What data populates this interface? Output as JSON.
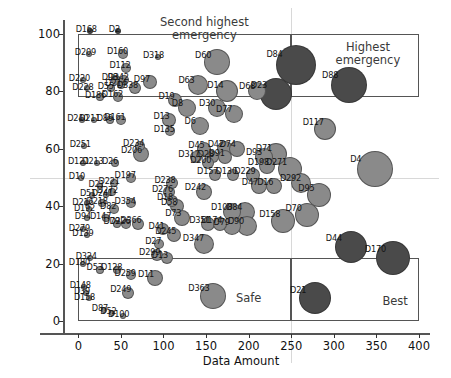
{
  "chart_data": {
    "type": "scatter",
    "title": "",
    "xlabel": "Data Amount",
    "ylabel": "Outlier Percentage",
    "xlim": [
      -18,
      400
    ],
    "ylim": [
      -4,
      104
    ],
    "xticks": [
      0,
      50,
      100,
      150,
      200,
      250,
      300,
      350,
      400
    ],
    "yticks": [
      0,
      20,
      40,
      60,
      80,
      100
    ],
    "grid": false,
    "guide_lines": {
      "x": 250,
      "y": 50
    },
    "bubble_colors": {
      "light": "#8a8a8a",
      "dark": "#4a4a4a"
    },
    "quadrants": [
      {
        "name": "second-highest-emergency",
        "label": "Second highest\nemergency",
        "x0": 0,
        "x1": 250,
        "y0": 78,
        "y1": 100,
        "label_x": 148,
        "label_y": 101.5
      },
      {
        "name": "highest-emergency",
        "label": "Highest emergency",
        "x0": 250,
        "x1": 400,
        "y0": 78,
        "y1": 100,
        "label_x": 340,
        "label_y": 93
      },
      {
        "name": "safe",
        "label": "Safe",
        "x0": 0,
        "x1": 250,
        "y0": 0,
        "y1": 22,
        "label_x": 200,
        "label_y": 8
      },
      {
        "name": "best",
        "label": "Best",
        "x0": 250,
        "x1": 400,
        "y0": 0,
        "y1": 22,
        "label_x": 372,
        "label_y": 7
      }
    ],
    "points": [
      {
        "label": "D168",
        "x": 14,
        "y": 101,
        "r": 3,
        "c": "dark"
      },
      {
        "label": "D2",
        "x": 47,
        "y": 101,
        "r": 3,
        "c": "dark"
      },
      {
        "label": "D209",
        "x": 13,
        "y": 93,
        "r": 3,
        "c": "light"
      },
      {
        "label": "D160",
        "x": 53,
        "y": 93,
        "r": 5,
        "c": "light"
      },
      {
        "label": "D318",
        "x": 93,
        "y": 92,
        "r": 3,
        "c": "light"
      },
      {
        "label": "D60",
        "x": 163,
        "y": 90,
        "r": 13,
        "c": "light"
      },
      {
        "label": "D84",
        "x": 255,
        "y": 89,
        "r": 20,
        "c": "dark"
      },
      {
        "label": "D88",
        "x": 318,
        "y": 82,
        "r": 18,
        "c": "dark"
      },
      {
        "label": "D112",
        "x": 56,
        "y": 88,
        "r": 5,
        "c": "light"
      },
      {
        "label": "D220",
        "x": 6,
        "y": 84,
        "r": 3,
        "c": "light"
      },
      {
        "label": "D98",
        "x": 44,
        "y": 84,
        "r": 5,
        "c": "light"
      },
      {
        "label": "D342",
        "x": 54,
        "y": 84,
        "r": 5,
        "c": "light"
      },
      {
        "label": "D97",
        "x": 84,
        "y": 83,
        "r": 7,
        "c": "light"
      },
      {
        "label": "D63",
        "x": 140,
        "y": 82,
        "r": 10,
        "c": "light"
      },
      {
        "label": "D228",
        "x": 10,
        "y": 81,
        "r": 3,
        "c": "light"
      },
      {
        "label": "D214",
        "x": 50,
        "y": 82,
        "r": 4,
        "c": "light"
      },
      {
        "label": "D55",
        "x": 38,
        "y": 81,
        "r": 4,
        "c": "light"
      },
      {
        "label": "D338",
        "x": 66,
        "y": 81,
        "r": 6,
        "c": "light"
      },
      {
        "label": "D14",
        "x": 175,
        "y": 80,
        "r": 11,
        "c": "light"
      },
      {
        "label": "D68",
        "x": 210,
        "y": 80,
        "r": 9,
        "c": "light"
      },
      {
        "label": "D23",
        "x": 232,
        "y": 79,
        "r": 16,
        "c": "dark"
      },
      {
        "label": "D186",
        "x": 26,
        "y": 78,
        "r": 4,
        "c": "light"
      },
      {
        "label": "D162",
        "x": 47,
        "y": 78,
        "r": 5,
        "c": "light"
      },
      {
        "label": "D19",
        "x": 113,
        "y": 77,
        "r": 7,
        "c": "light"
      },
      {
        "label": "D8",
        "x": 128,
        "y": 74,
        "r": 9,
        "c": "light"
      },
      {
        "label": "D30",
        "x": 163,
        "y": 74,
        "r": 9,
        "c": "light"
      },
      {
        "label": "D77",
        "x": 183,
        "y": 72,
        "r": 9,
        "c": "light"
      },
      {
        "label": "D89",
        "x": 37,
        "y": 70,
        "r": 4,
        "c": "light"
      },
      {
        "label": "D161",
        "x": 50,
        "y": 70,
        "r": 5,
        "c": "light"
      },
      {
        "label": "D13",
        "x": 107,
        "y": 70,
        "r": 7,
        "c": "light"
      },
      {
        "label": "D135",
        "x": 108,
        "y": 66,
        "r": 5,
        "c": "light"
      },
      {
        "label": "D6",
        "x": 143,
        "y": 68,
        "r": 9,
        "c": "light"
      },
      {
        "label": "D117",
        "x": 290,
        "y": 67,
        "r": 11,
        "c": "light"
      },
      {
        "label": "D240",
        "x": 4,
        "y": 70,
        "r": 3,
        "c": "light"
      },
      {
        "label": "D211",
        "x": 18,
        "y": 70,
        "r": 3,
        "c": "light"
      },
      {
        "label": "D251",
        "x": 7,
        "y": 61,
        "r": 3,
        "c": "light"
      },
      {
        "label": "D234",
        "x": 72,
        "y": 61,
        "r": 5,
        "c": "light"
      },
      {
        "label": "D206",
        "x": 73,
        "y": 58,
        "r": 8,
        "c": "light"
      },
      {
        "label": "D45",
        "x": 148,
        "y": 60,
        "r": 7,
        "c": "light"
      },
      {
        "label": "D42",
        "x": 172,
        "y": 60,
        "r": 8,
        "c": "light"
      },
      {
        "label": "D74",
        "x": 186,
        "y": 60,
        "r": 8,
        "c": "light"
      },
      {
        "label": "D317",
        "x": 138,
        "y": 57,
        "r": 6,
        "c": "light"
      },
      {
        "label": "D28",
        "x": 158,
        "y": 57,
        "r": 6,
        "c": "light"
      },
      {
        "label": "D91",
        "x": 172,
        "y": 57,
        "r": 7,
        "c": "light"
      },
      {
        "label": "D93",
        "x": 218,
        "y": 57,
        "r": 9,
        "c": "light"
      },
      {
        "label": "D71",
        "x": 232,
        "y": 58,
        "r": 11,
        "c": "light"
      },
      {
        "label": "D200",
        "x": 152,
        "y": 55,
        "r": 6,
        "c": "light"
      },
      {
        "label": "D198",
        "x": 222,
        "y": 54,
        "r": 8,
        "c": "light"
      },
      {
        "label": "D4",
        "x": 348,
        "y": 53,
        "r": 18,
        "c": "light"
      },
      {
        "label": "D121",
        "x": 5,
        "y": 55,
        "r": 3,
        "c": "light"
      },
      {
        "label": "D213",
        "x": 22,
        "y": 55,
        "r": 3,
        "c": "light"
      },
      {
        "label": "D26",
        "x": 43,
        "y": 55,
        "r": 4,
        "c": "light"
      },
      {
        "label": "D157",
        "x": 160,
        "y": 51,
        "r": 6,
        "c": "light"
      },
      {
        "label": "D130",
        "x": 182,
        "y": 51,
        "r": 6,
        "c": "light"
      },
      {
        "label": "D229",
        "x": 205,
        "y": 51,
        "r": 7,
        "c": "light"
      },
      {
        "label": "D271",
        "x": 248,
        "y": 53,
        "r": 12,
        "c": "light"
      },
      {
        "label": "D292",
        "x": 262,
        "y": 48,
        "r": 10,
        "c": "light"
      },
      {
        "label": "D10",
        "x": 3,
        "y": 50,
        "r": 3,
        "c": "light"
      },
      {
        "label": "D197",
        "x": 62,
        "y": 50,
        "r": 5,
        "c": "light"
      },
      {
        "label": "D221",
        "x": 42,
        "y": 48,
        "r": 4,
        "c": "light"
      },
      {
        "label": "D21",
        "x": 26,
        "y": 47,
        "r": 3,
        "c": "light"
      },
      {
        "label": "D47",
        "x": 212,
        "y": 47,
        "r": 8,
        "c": "light"
      },
      {
        "label": "D16",
        "x": 230,
        "y": 47,
        "r": 8,
        "c": "light"
      },
      {
        "label": "D95",
        "x": 283,
        "y": 44,
        "r": 12,
        "c": "light"
      },
      {
        "label": "D242",
        "x": 148,
        "y": 45,
        "r": 8,
        "c": "light"
      },
      {
        "label": "D51",
        "x": 16,
        "y": 44,
        "r": 3,
        "c": "light"
      },
      {
        "label": "D241",
        "x": 33,
        "y": 44,
        "r": 3,
        "c": "light"
      },
      {
        "label": "D272",
        "x": 40,
        "y": 45,
        "r": 4,
        "c": "light"
      },
      {
        "label": "D276",
        "x": 107,
        "y": 45,
        "r": 6,
        "c": "light"
      },
      {
        "label": "D238",
        "x": 110,
        "y": 48,
        "r": 6,
        "c": "light"
      },
      {
        "label": "D216",
        "x": 10,
        "y": 41,
        "r": 3,
        "c": "light"
      },
      {
        "label": "D218",
        "x": 28,
        "y": 41,
        "r": 4,
        "c": "light"
      },
      {
        "label": "D192",
        "x": 12,
        "y": 39,
        "r": 3,
        "c": "light"
      },
      {
        "label": "D354",
        "x": 62,
        "y": 41,
        "r": 5,
        "c": "light"
      },
      {
        "label": "D18",
        "x": 110,
        "y": 42,
        "r": 6,
        "c": "light"
      },
      {
        "label": "D58",
        "x": 116,
        "y": 40,
        "r": 7,
        "c": "light"
      },
      {
        "label": "D82",
        "x": 42,
        "y": 39,
        "r": 5,
        "c": "light"
      },
      {
        "label": "D73",
        "x": 122,
        "y": 36,
        "r": 8,
        "c": "light"
      },
      {
        "label": "D147",
        "x": 32,
        "y": 36,
        "r": 4,
        "c": "light"
      },
      {
        "label": "D108",
        "x": 180,
        "y": 38,
        "r": 9,
        "c": "light"
      },
      {
        "label": "D84b",
        "x": 196,
        "y": 38,
        "r": 10,
        "c": "light"
      },
      {
        "label": "D94",
        "x": 10,
        "y": 36,
        "r": 3,
        "c": "light"
      },
      {
        "label": "D79",
        "x": 45,
        "y": 34,
        "r": 4,
        "c": "light"
      },
      {
        "label": "D226",
        "x": 56,
        "y": 34,
        "r": 5,
        "c": "light"
      },
      {
        "label": "D366",
        "x": 70,
        "y": 34,
        "r": 6,
        "c": "light"
      },
      {
        "label": "D351",
        "x": 152,
        "y": 34,
        "r": 7,
        "c": "light"
      },
      {
        "label": "D174",
        "x": 166,
        "y": 34,
        "r": 7,
        "c": "light"
      },
      {
        "label": "D79b",
        "x": 180,
        "y": 33,
        "r": 9,
        "c": "light"
      },
      {
        "label": "D90",
        "x": 198,
        "y": 33,
        "r": 10,
        "c": "light"
      },
      {
        "label": "D158",
        "x": 240,
        "y": 35,
        "r": 12,
        "c": "light"
      },
      {
        "label": "D70",
        "x": 268,
        "y": 37,
        "r": 12,
        "c": "light"
      },
      {
        "label": "D279",
        "x": 6,
        "y": 32,
        "r": 3,
        "c": "light"
      },
      {
        "label": "D139",
        "x": 10,
        "y": 30,
        "r": 3,
        "c": "light"
      },
      {
        "label": "D41",
        "x": 100,
        "y": 32,
        "r": 6,
        "c": "light"
      },
      {
        "label": "D245",
        "x": 112,
        "y": 30,
        "r": 7,
        "c": "light"
      },
      {
        "label": "D347",
        "x": 148,
        "y": 27,
        "r": 10,
        "c": "light"
      },
      {
        "label": "D44",
        "x": 320,
        "y": 26,
        "r": 16,
        "c": "dark"
      },
      {
        "label": "D170",
        "x": 370,
        "y": 22,
        "r": 17,
        "c": "dark"
      },
      {
        "label": "D27",
        "x": 95,
        "y": 27,
        "r": 5,
        "c": "light"
      },
      {
        "label": "D299",
        "x": 92,
        "y": 23,
        "r": 6,
        "c": "light"
      },
      {
        "label": "D13b",
        "x": 104,
        "y": 22,
        "r": 6,
        "c": "light"
      },
      {
        "label": "D324",
        "x": 14,
        "y": 22,
        "r": 3,
        "c": "light"
      },
      {
        "label": "D180",
        "x": 6,
        "y": 20,
        "r": 3,
        "c": "light"
      },
      {
        "label": "D53",
        "x": 25,
        "y": 18,
        "r": 4,
        "c": "light"
      },
      {
        "label": "D128",
        "x": 45,
        "y": 18,
        "r": 4,
        "c": "light"
      },
      {
        "label": "D259",
        "x": 62,
        "y": 16,
        "r": 5,
        "c": "light"
      },
      {
        "label": "D11",
        "x": 90,
        "y": 15,
        "r": 8,
        "c": "light"
      },
      {
        "label": "D148",
        "x": 7,
        "y": 12,
        "r": 3,
        "c": "light"
      },
      {
        "label": "D39",
        "x": 9,
        "y": 10,
        "r": 3,
        "c": "light"
      },
      {
        "label": "D158b",
        "x": 12,
        "y": 8,
        "r": 3,
        "c": "light"
      },
      {
        "label": "D249",
        "x": 58,
        "y": 10,
        "r": 6,
        "c": "light"
      },
      {
        "label": "D363",
        "x": 158,
        "y": 9,
        "r": 13,
        "c": "light"
      },
      {
        "label": "D21b",
        "x": 278,
        "y": 8,
        "r": 16,
        "c": "dark"
      },
      {
        "label": "D87",
        "x": 30,
        "y": 4,
        "r": 3,
        "c": "light"
      },
      {
        "label": "D52",
        "x": 40,
        "y": 3,
        "r": 3,
        "c": "light"
      },
      {
        "label": "D100",
        "x": 52,
        "y": 2,
        "r": 3,
        "c": "light"
      }
    ]
  }
}
